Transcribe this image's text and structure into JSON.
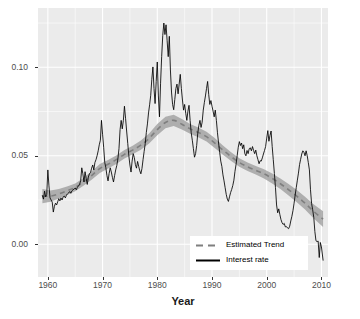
{
  "chart_data": {
    "type": "line",
    "title": "",
    "subtitle": "",
    "xlabel": "Year",
    "ylabel": "",
    "xlim": [
      1958.2,
      2011.2
    ],
    "ylim": [
      -0.0185,
      0.1335
    ],
    "xticks": [
      1960,
      1970,
      1980,
      1990,
      2000,
      2010
    ],
    "xtick_labels": [
      "1960",
      "1970",
      "1980",
      "1990",
      "2000",
      "2010"
    ],
    "yticks": [
      0.0,
      0.05,
      0.1
    ],
    "ytick_labels": [
      "0.00",
      "0.05",
      "0.10"
    ],
    "grid": true,
    "grid_color": "#ffffff",
    "panel_background": "#ebebeb",
    "legend_position": "inside-bottom-center",
    "legend": [
      {
        "label": "Estimated Trend",
        "style": "dashed",
        "color": "#7f7f7f"
      },
      {
        "label": "Interest rate",
        "style": "solid",
        "color": "#000000"
      }
    ],
    "series": [
      {
        "name": "Interest rate",
        "style": "solid",
        "color": "#000000",
        "x": [
          1959.0,
          1959.2,
          1959.4,
          1959.6,
          1959.8,
          1960.0,
          1960.2,
          1960.4,
          1960.6,
          1960.8,
          1961.0,
          1961.2,
          1961.4,
          1961.6,
          1961.8,
          1962.0,
          1962.2,
          1962.4,
          1962.6,
          1962.8,
          1963.0,
          1963.2,
          1963.4,
          1963.6,
          1963.8,
          1964.0,
          1964.2,
          1964.4,
          1964.6,
          1964.8,
          1965.0,
          1965.2,
          1965.4,
          1965.6,
          1965.8,
          1966.0,
          1966.2,
          1966.4,
          1966.6,
          1966.8,
          1967.0,
          1967.2,
          1967.4,
          1967.6,
          1967.8,
          1968.0,
          1968.2,
          1968.4,
          1968.6,
          1968.8,
          1969.0,
          1969.2,
          1969.4,
          1969.6,
          1969.8,
          1970.0,
          1970.2,
          1970.4,
          1970.6,
          1970.8,
          1971.0,
          1971.2,
          1971.4,
          1971.6,
          1971.8,
          1972.0,
          1972.2,
          1972.4,
          1972.6,
          1972.8,
          1973.0,
          1973.2,
          1973.4,
          1973.6,
          1973.8,
          1974.0,
          1974.2,
          1974.4,
          1974.6,
          1974.8,
          1975.0,
          1975.2,
          1975.4,
          1975.6,
          1975.8,
          1976.0,
          1976.2,
          1976.4,
          1976.6,
          1976.8,
          1977.0,
          1977.2,
          1977.4,
          1977.6,
          1977.8,
          1978.0,
          1978.2,
          1978.4,
          1978.6,
          1978.8,
          1979.0,
          1979.2,
          1979.4,
          1979.6,
          1979.8,
          1980.0,
          1980.2,
          1980.4,
          1980.6,
          1980.8,
          1981.0,
          1981.2,
          1981.4,
          1981.6,
          1981.8,
          1982.0,
          1982.2,
          1982.4,
          1982.6,
          1982.8,
          1983.0,
          1983.2,
          1983.4,
          1983.6,
          1983.8,
          1984.0,
          1984.2,
          1984.4,
          1984.6,
          1984.8,
          1985.0,
          1985.2,
          1985.4,
          1985.6,
          1985.8,
          1986.0,
          1986.2,
          1986.4,
          1986.6,
          1986.8,
          1987.0,
          1987.2,
          1987.4,
          1987.6,
          1987.8,
          1988.0,
          1988.2,
          1988.4,
          1988.6,
          1988.8,
          1989.0,
          1989.2,
          1989.4,
          1989.6,
          1989.8,
          1990.0,
          1990.2,
          1990.4,
          1990.6,
          1990.8,
          1991.0,
          1991.2,
          1991.4,
          1991.6,
          1991.8,
          1992.0,
          1992.2,
          1992.4,
          1992.6,
          1992.8,
          1993.0,
          1993.2,
          1993.4,
          1993.6,
          1993.8,
          1994.0,
          1994.2,
          1994.4,
          1994.6,
          1994.8,
          1995.0,
          1995.2,
          1995.4,
          1995.6,
          1995.8,
          1996.0,
          1996.2,
          1996.4,
          1996.6,
          1996.8,
          1997.0,
          1997.2,
          1997.4,
          1997.6,
          1997.8,
          1998.0,
          1998.2,
          1998.4,
          1998.6,
          1998.8,
          1999.0,
          1999.2,
          1999.4,
          1999.6,
          1999.8,
          2000.0,
          2000.2,
          2000.4,
          2000.6,
          2000.8,
          2001.0,
          2001.2,
          2001.4,
          2001.6,
          2001.8,
          2002.0,
          2002.2,
          2002.4,
          2002.6,
          2002.8,
          2003.0,
          2003.2,
          2003.4,
          2003.6,
          2003.8,
          2004.0,
          2004.2,
          2004.4,
          2004.6,
          2004.8,
          2005.0,
          2005.2,
          2005.4,
          2005.6,
          2005.8,
          2006.0,
          2006.2,
          2006.4,
          2006.6,
          2006.8,
          2007.0,
          2007.2,
          2007.4,
          2007.6,
          2007.8,
          2008.0,
          2008.2,
          2008.4,
          2008.6,
          2008.8,
          2009.0,
          2009.2,
          2009.4,
          2009.6,
          2009.8,
          2010.0,
          2010.3
        ],
        "y": [
          0.0275,
          0.0255,
          0.03,
          0.0268,
          0.0282,
          0.042,
          0.033,
          0.0262,
          0.025,
          0.0238,
          0.0182,
          0.0215,
          0.0232,
          0.0222,
          0.024,
          0.0258,
          0.0245,
          0.0262,
          0.025,
          0.0268,
          0.0272,
          0.0262,
          0.0278,
          0.0285,
          0.029,
          0.0298,
          0.0288,
          0.0302,
          0.0308,
          0.0312,
          0.0318,
          0.0308,
          0.0322,
          0.033,
          0.0338,
          0.036,
          0.0432,
          0.0398,
          0.0352,
          0.041,
          0.0372,
          0.0338,
          0.038,
          0.0398,
          0.0405,
          0.043,
          0.0448,
          0.042,
          0.0462,
          0.0478,
          0.05,
          0.0528,
          0.0562,
          0.0588,
          0.07,
          0.0622,
          0.0548,
          0.0462,
          0.0432,
          0.0388,
          0.0358,
          0.04,
          0.0432,
          0.0408,
          0.0378,
          0.0352,
          0.0388,
          0.042,
          0.0445,
          0.0482,
          0.054,
          0.0648,
          0.07,
          0.0652,
          0.07,
          0.078,
          0.0712,
          0.064,
          0.057,
          0.05,
          0.0448,
          0.0408,
          0.047,
          0.0512,
          0.049,
          0.045,
          0.043,
          0.0468,
          0.044,
          0.0415,
          0.0398,
          0.0428,
          0.0478,
          0.0525,
          0.057,
          0.0632,
          0.068,
          0.0742,
          0.0788,
          0.0842,
          0.0932,
          0.1002,
          0.088,
          0.0795,
          0.092,
          0.103,
          0.0838,
          0.072,
          0.091,
          0.106,
          0.118,
          0.125,
          0.1185,
          0.124,
          0.115,
          0.106,
          0.1175,
          0.0985,
          0.086,
          0.079,
          0.076,
          0.0818,
          0.088,
          0.0905,
          0.085,
          0.0905,
          0.096,
          0.088,
          0.0815,
          0.0758,
          0.079,
          0.074,
          0.07,
          0.0752,
          0.0785,
          0.07,
          0.063,
          0.0588,
          0.054,
          0.0492,
          0.0512,
          0.0558,
          0.0628,
          0.0672,
          0.07,
          0.066,
          0.069,
          0.0758,
          0.08,
          0.0838,
          0.088,
          0.092,
          0.0845,
          0.079,
          0.0812,
          0.078,
          0.0752,
          0.072,
          0.0758,
          0.07,
          0.063,
          0.0572,
          0.052,
          0.047,
          0.044,
          0.0392,
          0.0358,
          0.032,
          0.0282,
          0.0255,
          0.0242,
          0.0268,
          0.0292,
          0.031,
          0.0332,
          0.0362,
          0.0412,
          0.0452,
          0.05,
          0.0548,
          0.058,
          0.0558,
          0.0572,
          0.054,
          0.0562,
          0.0512,
          0.05,
          0.053,
          0.0512,
          0.054,
          0.0545,
          0.0528,
          0.0552,
          0.053,
          0.0512,
          0.0532,
          0.05,
          0.0478,
          0.0455,
          0.0472,
          0.047,
          0.0488,
          0.051,
          0.053,
          0.0552,
          0.06,
          0.0642,
          0.0582,
          0.0615,
          0.064,
          0.0552,
          0.0478,
          0.04,
          0.032,
          0.0222,
          0.0178,
          0.02,
          0.0168,
          0.014,
          0.0122,
          0.0112,
          0.0118,
          0.0098,
          0.01,
          0.0092,
          0.0088,
          0.0102,
          0.0132,
          0.0158,
          0.019,
          0.0232,
          0.0278,
          0.032,
          0.0362,
          0.0402,
          0.045,
          0.048,
          0.051,
          0.0528,
          0.052,
          0.05,
          0.0528,
          0.05,
          0.0462,
          0.042,
          0.0308,
          0.023,
          0.0195,
          0.0152,
          0.0072,
          0.002,
          0.0015,
          0.0018,
          -0.0075,
          0.001,
          -0.0015,
          -0.009
        ]
      },
      {
        "name": "Estimated Trend",
        "style": "dashed",
        "color": "#7f7f7f",
        "x": [
          1959.0,
          1960.5,
          1962.0,
          1963.5,
          1965.0,
          1966.5,
          1968.0,
          1969.5,
          1971.0,
          1972.5,
          1974.0,
          1975.5,
          1977.0,
          1978.5,
          1980.0,
          1981.5,
          1983.0,
          1984.5,
          1986.0,
          1987.5,
          1989.0,
          1990.5,
          1992.0,
          1993.5,
          1995.0,
          1996.5,
          1998.0,
          1999.5,
          2001.0,
          2002.5,
          2004.0,
          2005.5,
          2007.0,
          2008.5,
          2010.3
        ],
        "y": [
          0.0272,
          0.0272,
          0.0285,
          0.0302,
          0.0322,
          0.0352,
          0.0388,
          0.0428,
          0.0452,
          0.0478,
          0.0508,
          0.0532,
          0.056,
          0.0598,
          0.0648,
          0.0688,
          0.07,
          0.0678,
          0.0652,
          0.0632,
          0.0608,
          0.0572,
          0.0532,
          0.0495,
          0.0462,
          0.0438,
          0.0418,
          0.0398,
          0.0372,
          0.0342,
          0.0308,
          0.0272,
          0.0232,
          0.0188,
          0.0142
        ],
        "ribbon_lower": [
          0.0232,
          0.024,
          0.0258,
          0.0278,
          0.03,
          0.033,
          0.0364,
          0.0402,
          0.0428,
          0.0454,
          0.0484,
          0.0508,
          0.0534,
          0.057,
          0.0616,
          0.0655,
          0.0668,
          0.0648,
          0.0624,
          0.0604,
          0.058,
          0.0544,
          0.0506,
          0.047,
          0.0438,
          0.0414,
          0.0394,
          0.0372,
          0.0344,
          0.0312,
          0.0276,
          0.0238,
          0.0196,
          0.0148,
          0.0098
        ],
        "ribbon_upper": [
          0.0312,
          0.0304,
          0.0312,
          0.0326,
          0.0344,
          0.0374,
          0.0412,
          0.0454,
          0.0476,
          0.0502,
          0.0532,
          0.0556,
          0.0586,
          0.0626,
          0.068,
          0.0721,
          0.0732,
          0.0708,
          0.068,
          0.066,
          0.0636,
          0.06,
          0.0558,
          0.052,
          0.0486,
          0.0462,
          0.0442,
          0.0424,
          0.04,
          0.0372,
          0.034,
          0.0306,
          0.0268,
          0.0228,
          0.0186
        ]
      }
    ]
  },
  "axis": {
    "x_title": "Year",
    "y_title": ""
  }
}
